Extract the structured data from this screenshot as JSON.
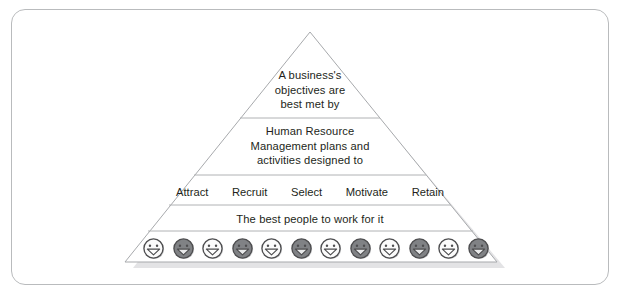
{
  "figure": {
    "type": "pyramid-diagram",
    "frame_border_color": "#b9bbbd",
    "text_color": "#231f20",
    "outline_color": "#a7a9ac",
    "shadow_color": "#d4d5d7",
    "background": "#ffffff"
  },
  "pyramid": {
    "apex": {
      "x": 310,
      "y": 32
    },
    "base_left": {
      "x": 125,
      "y": 262
    },
    "base_right": {
      "x": 497,
      "y": 262
    },
    "divider_y": [
      118,
      175,
      205,
      231
    ],
    "tiers": [
      {
        "id": "tier-1",
        "name": "objectives",
        "lines": [
          "A business's",
          "objectives are",
          "best met by"
        ],
        "text": "A business's\nobjectives are\nbest met by"
      },
      {
        "id": "tier-2",
        "name": "hrm-plans",
        "lines": [
          "Human Resource",
          "Management plans and",
          "activities designed to"
        ],
        "text": "Human Resource\nManagement plans and\nactivities designed to"
      },
      {
        "id": "tier-3",
        "name": "hr-activities",
        "items": [
          "Attract",
          "Recruit",
          "Select",
          "Motivate",
          "Retain"
        ]
      },
      {
        "id": "tier-4",
        "name": "people",
        "text": "The best people to work for it"
      },
      {
        "id": "tier-5",
        "name": "people-icons",
        "icon_name": "smiley-face-icon",
        "icon_count": 12,
        "icon_shades": [
          "light",
          "dark",
          "light",
          "dark",
          "light",
          "dark",
          "light",
          "dark",
          "light",
          "dark",
          "light",
          "dark"
        ],
        "light_fill": "#fbfbfb",
        "dark_fill": "#808285",
        "icon_outline": "#4d4d4f"
      }
    ]
  }
}
